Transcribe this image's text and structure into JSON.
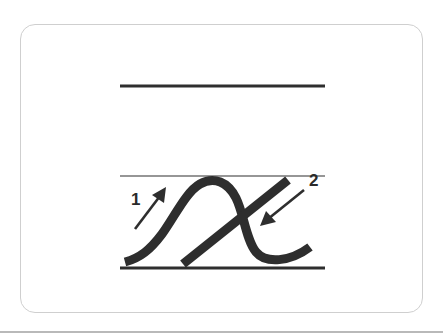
{
  "figure": {
    "letter": "x",
    "guide_lines": [
      "top-line",
      "midline",
      "baseline"
    ],
    "strokes": [
      {
        "order": "1",
        "label": "1",
        "direction": "up-right",
        "shape": "curved hump stroke"
      },
      {
        "order": "2",
        "label": "2",
        "direction": "down-left",
        "shape": "diagonal cross stroke"
      }
    ],
    "colors": {
      "ink": "#2e2e2e",
      "card_border": "#cfcfcf",
      "background": "#ffffff"
    }
  }
}
